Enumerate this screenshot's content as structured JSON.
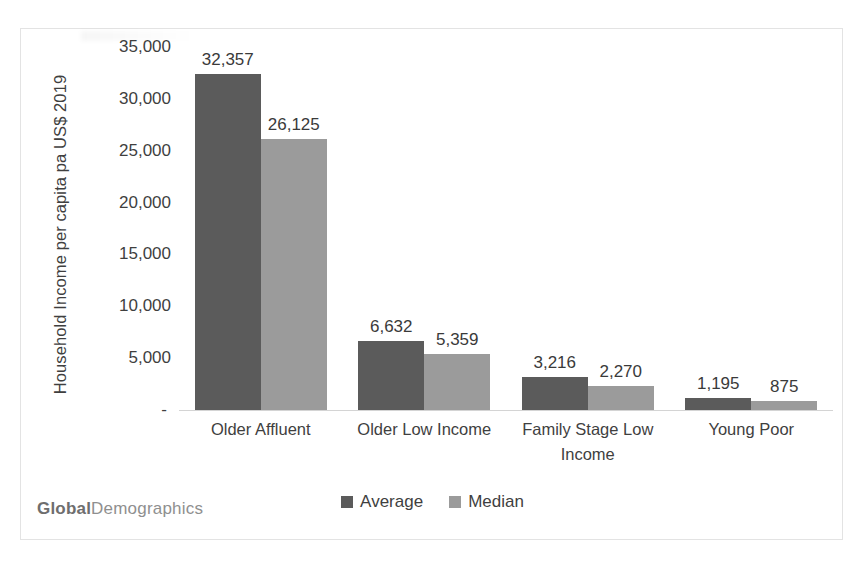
{
  "watermark": {
    "bold_part": "Global",
    "light_part": "Demographics"
  },
  "chart_data": {
    "type": "bar",
    "title": "",
    "xlabel": "",
    "ylabel": "Household Income per capita pa US$ 2019",
    "ylim": [
      0,
      35000
    ],
    "ytick_values": [
      35000,
      30000,
      25000,
      20000,
      15000,
      10000,
      5000,
      0
    ],
    "ytick_labels": [
      "35,000",
      "30,000",
      "25,000",
      "20,000",
      "15,000",
      "10,000",
      "5,000",
      "-"
    ],
    "grid": false,
    "legend_position": "bottom",
    "categories": [
      "Older Affluent",
      "Older Low Income",
      "Family Stage Low Income",
      "Young Poor"
    ],
    "series": [
      {
        "name": "Average",
        "color": "#5b5b5b",
        "values": [
          32357,
          6632,
          3216,
          1195
        ],
        "labels": [
          "32,357",
          "6,632",
          "3,216",
          "1,195"
        ]
      },
      {
        "name": "Median",
        "color": "#9b9b9b",
        "values": [
          26125,
          5359,
          2270,
          875
        ],
        "labels": [
          "26,125",
          "5,359",
          "2,270",
          "875"
        ]
      }
    ]
  }
}
